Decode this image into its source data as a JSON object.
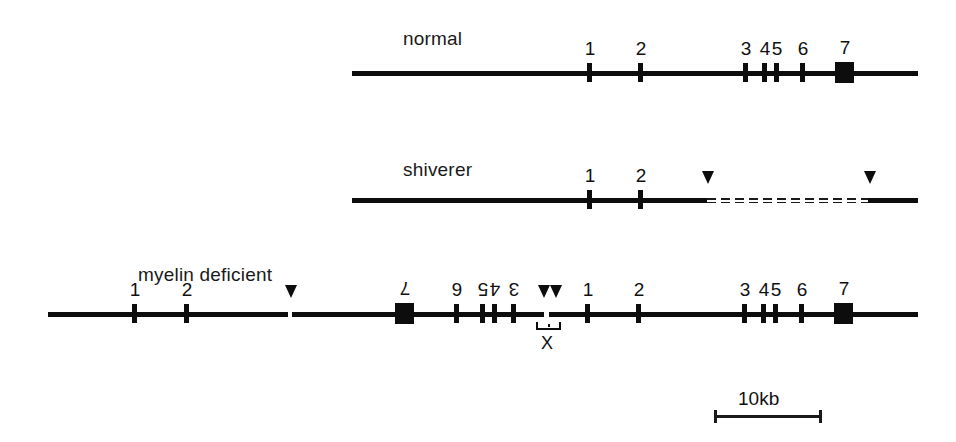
{
  "figure": {
    "ink_color": "#0d0d0d",
    "background_color": "#ffffff"
  },
  "scale": {
    "label": "10kb",
    "bar_length_px": 108
  },
  "rows": [
    {
      "id": "normal",
      "label": "normal",
      "label_x": 403,
      "label_y": 29,
      "axis": {
        "x": 352,
        "y": 71,
        "width": 566,
        "height": 5
      },
      "exons": [
        {
          "number": "1",
          "x": 590,
          "flipped": false,
          "type": "tick"
        },
        {
          "number": "2",
          "x": 641,
          "flipped": false,
          "type": "tick"
        },
        {
          "number": "3",
          "x": 746,
          "flipped": false,
          "type": "tick"
        },
        {
          "number": "4",
          "x": 765,
          "flipped": false,
          "type": "tick"
        },
        {
          "number": "5",
          "x": 777,
          "flipped": false,
          "type": "tick"
        },
        {
          "number": "6",
          "x": 803,
          "flipped": false,
          "type": "tick"
        },
        {
          "number": "7",
          "x": 845,
          "flipped": false,
          "type": "box"
        }
      ],
      "arrowheads": [],
      "breaks": [],
      "deletion": null
    },
    {
      "id": "shiverer",
      "label": "shiverer",
      "label_x": 403,
      "label_y": 160,
      "axis": {
        "x": 352,
        "y": 198,
        "width": 355,
        "height": 5
      },
      "axis_right": {
        "x": 868,
        "y": 198,
        "width": 50,
        "height": 5
      },
      "exons": [
        {
          "number": "1",
          "x": 590,
          "flipped": false,
          "type": "tick"
        },
        {
          "number": "2",
          "x": 641,
          "flipped": false,
          "type": "tick"
        }
      ],
      "arrowheads": [
        {
          "x": 702,
          "y": 171
        },
        {
          "x": 864,
          "y": 171
        }
      ],
      "breaks": [],
      "deletion": {
        "x": 707,
        "y": 198,
        "width": 161
      }
    },
    {
      "id": "myelin-deficient",
      "label": "myelin deficient",
      "label_x": 138,
      "label_y": 265,
      "axis": {
        "x": 48,
        "y": 312,
        "width": 870,
        "height": 5
      },
      "exons": [
        {
          "number": "1",
          "x": 135,
          "flipped": false,
          "type": "tick"
        },
        {
          "number": "2",
          "x": 187,
          "flipped": false,
          "type": "tick"
        },
        {
          "number": "7",
          "x": 405,
          "flipped": true,
          "type": "box"
        },
        {
          "number": "6",
          "x": 457,
          "flipped": true,
          "type": "tick"
        },
        {
          "number": "5",
          "x": 483,
          "flipped": true,
          "type": "tick"
        },
        {
          "number": "4",
          "x": 495,
          "flipped": true,
          "type": "tick"
        },
        {
          "number": "3",
          "x": 514,
          "flipped": true,
          "type": "tick"
        },
        {
          "number": "1",
          "x": 588,
          "flipped": false,
          "type": "tick"
        },
        {
          "number": "2",
          "x": 639,
          "flipped": false,
          "type": "tick"
        },
        {
          "number": "3",
          "x": 745,
          "flipped": false,
          "type": "tick"
        },
        {
          "number": "4",
          "x": 764,
          "flipped": false,
          "type": "tick"
        },
        {
          "number": "5",
          "x": 776,
          "flipped": false,
          "type": "tick"
        },
        {
          "number": "6",
          "x": 802,
          "flipped": false,
          "type": "tick"
        },
        {
          "number": "7",
          "x": 844,
          "flipped": false,
          "type": "box"
        }
      ],
      "arrowheads": [
        {
          "x": 285,
          "y": 285
        },
        {
          "x": 538,
          "y": 285
        },
        {
          "x": 550,
          "y": 285
        }
      ],
      "breaks": [
        {
          "x": 288,
          "y": 310,
          "width": 4,
          "height": 9
        },
        {
          "x": 544,
          "y": 310,
          "width": 5,
          "height": 9
        }
      ],
      "junction": {
        "label": "X",
        "bracket_x": 536,
        "bracket_y": 322,
        "bracket_width": 21,
        "label_x": 541,
        "label_y": 334
      },
      "deletion": null
    }
  ]
}
